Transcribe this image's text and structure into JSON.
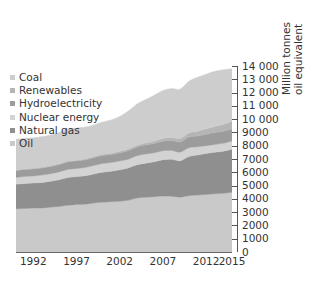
{
  "chart_data": {
    "type": "area",
    "stacked": true,
    "title": "",
    "subtitle": "",
    "xlabel": "",
    "ylabel": "Million tonnes oil equivalent",
    "ylabel_lines": [
      "Million tonnes",
      "oil equivalent"
    ],
    "xlim": [
      1990,
      2015
    ],
    "ylim": [
      0,
      14000
    ],
    "ytick_step": 1000,
    "grid": false,
    "legend_position": "upper-left",
    "x": [
      1990,
      1991,
      1992,
      1993,
      1994,
      1995,
      1996,
      1997,
      1998,
      1999,
      2000,
      2001,
      2002,
      2003,
      2004,
      2005,
      2006,
      2007,
      2008,
      2009,
      2010,
      2011,
      2012,
      2013,
      2014,
      2015
    ],
    "xticks": [
      1992,
      1997,
      2002,
      2007,
      2012,
      2015
    ],
    "xtick_labels": [
      "1992",
      "1997",
      "2002",
      "2007",
      "2012",
      "2015"
    ],
    "yticks": [
      0,
      1000,
      2000,
      3000,
      4000,
      5000,
      6000,
      7000,
      8000,
      9000,
      10000,
      11000,
      12000,
      13000,
      14000
    ],
    "ytick_labels": [
      "0",
      "1000",
      "2000",
      "3000",
      "4000",
      "5000",
      "6000",
      "7000",
      "8000",
      "9000",
      "10 000",
      "11 000",
      "12 000",
      "13 000",
      "14 000"
    ],
    "stack_order_bottom_to_top": [
      "Oil",
      "Natural gas",
      "Nuclear energy",
      "Hydroelectricity",
      "Renewables",
      "Coal"
    ],
    "series": [
      {
        "name": "Oil",
        "color": "#c9c9c9",
        "values": [
          3150,
          3170,
          3200,
          3210,
          3270,
          3320,
          3400,
          3470,
          3490,
          3580,
          3630,
          3660,
          3700,
          3770,
          3930,
          3990,
          4030,
          4080,
          4060,
          4000,
          4110,
          4150,
          4200,
          4240,
          4290,
          4360
        ]
      },
      {
        "name": "Natural gas",
        "color": "#8f8f8f",
        "values": [
          1790,
          1820,
          1830,
          1860,
          1890,
          1950,
          2030,
          2030,
          2070,
          2110,
          2190,
          2220,
          2290,
          2360,
          2430,
          2490,
          2550,
          2650,
          2700,
          2650,
          2850,
          2920,
          2990,
          3040,
          3060,
          3140
        ]
      },
      {
        "name": "Nuclear energy",
        "color": "#d3d3d3",
        "values": [
          500,
          520,
          520,
          540,
          550,
          570,
          590,
          590,
          600,
          620,
          630,
          640,
          650,
          640,
          660,
          660,
          660,
          650,
          640,
          630,
          640,
          600,
          560,
          565,
          575,
          585
        ]
      },
      {
        "name": "Hydroelectricity",
        "color": "#9c9c9c",
        "values": [
          490,
          500,
          505,
          515,
          520,
          535,
          550,
          545,
          560,
          570,
          590,
          585,
          600,
          620,
          640,
          660,
          680,
          700,
          730,
          740,
          780,
          790,
          830,
          860,
          880,
          890
        ]
      },
      {
        "name": "Renewables",
        "color": "#b5b5b5",
        "values": [
          40,
          42,
          45,
          48,
          52,
          56,
          60,
          64,
          70,
          76,
          84,
          92,
          102,
          114,
          128,
          146,
          168,
          194,
          228,
          258,
          300,
          348,
          400,
          450,
          500,
          560
        ]
      },
      {
        "name": "Coal",
        "color": "#cdcdcd",
        "values": [
          2250,
          2240,
          2230,
          2240,
          2250,
          2290,
          2340,
          2340,
          2320,
          2310,
          2350,
          2430,
          2540,
          2770,
          3000,
          3180,
          3350,
          3500,
          3570,
          3600,
          3770,
          3930,
          3990,
          4020,
          3990,
          3830
        ]
      }
    ],
    "totals": [
      8220,
      8292,
      8330,
      8413,
      8532,
      8721,
      8970,
      9039,
      9110,
      9266,
      9474,
      9627,
      9882,
      10274,
      10788,
      11126,
      11438,
      11774,
      11928,
      11878,
      12450,
      12738,
      12970,
      13175,
      13295,
      13365
    ]
  },
  "legend": {
    "items": [
      {
        "label": "Coal",
        "color": "#cdcdcd"
      },
      {
        "label": "Renewables",
        "color": "#b5b5b5"
      },
      {
        "label": "Hydroelectricity",
        "color": "#9c9c9c"
      },
      {
        "label": "Nuclear energy",
        "color": "#d3d3d3"
      },
      {
        "label": "Natural gas",
        "color": "#8f8f8f"
      },
      {
        "label": "Oil",
        "color": "#c9c9c9"
      }
    ]
  },
  "axes": {
    "y_title_line1": "Million tonnes",
    "y_title_line2": "oil equivalent",
    "axis_color": "#555555"
  }
}
